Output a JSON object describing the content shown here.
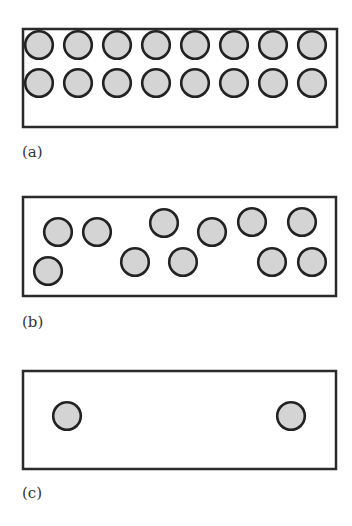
{
  "colors": {
    "background": "#ffffff",
    "box_stroke": "#2a2a2a",
    "particle_fill": "#d4d4d4",
    "particle_stroke": "#222222",
    "label": "#333333"
  },
  "panels": [
    {
      "id": "a",
      "label": "(a)",
      "box": {
        "x": 23,
        "y": 29,
        "w": 314,
        "h": 98
      },
      "label_pos": {
        "x": 22,
        "y": 157
      },
      "particle_radius": 15,
      "particle_count": 16,
      "particles": [
        {
          "cx": 39,
          "cy": 45
        },
        {
          "cx": 78,
          "cy": 45
        },
        {
          "cx": 117,
          "cy": 45
        },
        {
          "cx": 156,
          "cy": 45
        },
        {
          "cx": 195,
          "cy": 45
        },
        {
          "cx": 234,
          "cy": 45
        },
        {
          "cx": 273,
          "cy": 45
        },
        {
          "cx": 312,
          "cy": 45
        },
        {
          "cx": 39,
          "cy": 83
        },
        {
          "cx": 78,
          "cy": 83
        },
        {
          "cx": 117,
          "cy": 83
        },
        {
          "cx": 156,
          "cy": 83
        },
        {
          "cx": 195,
          "cy": 83
        },
        {
          "cx": 234,
          "cy": 83
        },
        {
          "cx": 273,
          "cy": 83
        },
        {
          "cx": 312,
          "cy": 83
        }
      ]
    },
    {
      "id": "b",
      "label": "(b)",
      "box": {
        "x": 23,
        "y": 197,
        "w": 313,
        "h": 99
      },
      "label_pos": {
        "x": 22,
        "y": 327
      },
      "particle_radius": 15,
      "particle_count": 11,
      "particles": [
        {
          "cx": 58,
          "cy": 232
        },
        {
          "cx": 97,
          "cy": 232
        },
        {
          "cx": 164,
          "cy": 223
        },
        {
          "cx": 212,
          "cy": 232
        },
        {
          "cx": 252,
          "cy": 222
        },
        {
          "cx": 302,
          "cy": 222
        },
        {
          "cx": 48,
          "cy": 271
        },
        {
          "cx": 135,
          "cy": 262
        },
        {
          "cx": 183,
          "cy": 262
        },
        {
          "cx": 272,
          "cy": 262
        },
        {
          "cx": 312,
          "cy": 262
        }
      ]
    },
    {
      "id": "c",
      "label": "(c)",
      "box": {
        "x": 23,
        "y": 371,
        "w": 313,
        "h": 98
      },
      "label_pos": {
        "x": 22,
        "y": 498
      },
      "particle_radius": 15,
      "particle_count": 2,
      "particles": [
        {
          "cx": 67,
          "cy": 416
        },
        {
          "cx": 291,
          "cy": 416
        }
      ]
    }
  ]
}
